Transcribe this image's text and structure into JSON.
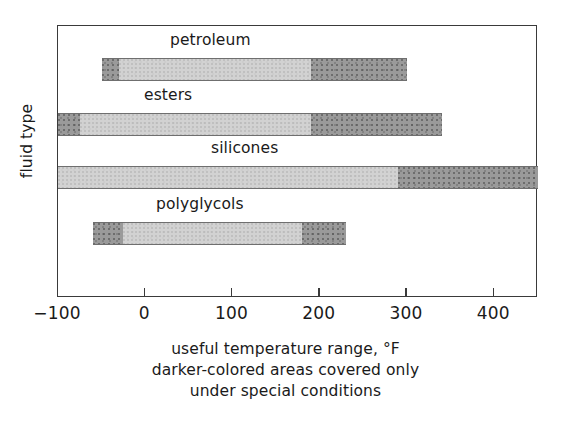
{
  "chart_data": {
    "type": "bar",
    "orientation": "horizontal",
    "title": "",
    "xlabel": "useful temperature range, °F",
    "ylabel": "fluid type",
    "xlim": [
      -100,
      450
    ],
    "xticks": [
      -100,
      0,
      100,
      200,
      300,
      400
    ],
    "xticklabels": [
      "−100",
      "0",
      "100",
      "200",
      "300",
      "400"
    ],
    "grid": false,
    "legend": "none",
    "note": "darker-colored areas covered only under special conditions",
    "categories": [
      "petroleum",
      "esters",
      "silicones",
      "polyglycols"
    ],
    "series": [
      {
        "name": "petroleum",
        "start": -50,
        "end": 300,
        "segments": [
          {
            "shade": "dark",
            "from": -50,
            "to": -30
          },
          {
            "shade": "light",
            "from": -30,
            "to": 190
          },
          {
            "shade": "dark",
            "from": 190,
            "to": 300
          }
        ]
      },
      {
        "name": "esters",
        "start": -100,
        "end": 340,
        "segments": [
          {
            "shade": "dark",
            "from": -100,
            "to": -75
          },
          {
            "shade": "light",
            "from": -75,
            "to": 190
          },
          {
            "shade": "dark",
            "from": 190,
            "to": 340
          }
        ]
      },
      {
        "name": "silicones",
        "start": -100,
        "end": 450,
        "segments": [
          {
            "shade": "light",
            "from": -100,
            "to": 290
          },
          {
            "shade": "dark",
            "from": 290,
            "to": 450
          }
        ]
      },
      {
        "name": "polyglycols",
        "start": -60,
        "end": 230,
        "segments": [
          {
            "shade": "dark",
            "from": -60,
            "to": -25
          },
          {
            "shade": "light",
            "from": -25,
            "to": 180
          },
          {
            "shade": "dark",
            "from": 180,
            "to": 230
          }
        ]
      }
    ]
  },
  "axis": {
    "y_label": "fluid type",
    "tick_labels": [
      "−100",
      "0",
      "100",
      "200",
      "300",
      "400"
    ]
  },
  "bar_labels": {
    "petroleum": "petroleum",
    "esters": "esters",
    "silicones": "silicones",
    "polyglycols": "polyglycols"
  },
  "captions": {
    "line1": "useful temperature range, °F",
    "line2": "darker-colored areas covered only",
    "line3": "under special conditions"
  },
  "colors": {
    "dark_segment": "#9a9a9a",
    "light_segment": "#d2d2d2",
    "frame": "#3a3a3a",
    "text": "#1a1a1a",
    "background": "#ffffff"
  }
}
